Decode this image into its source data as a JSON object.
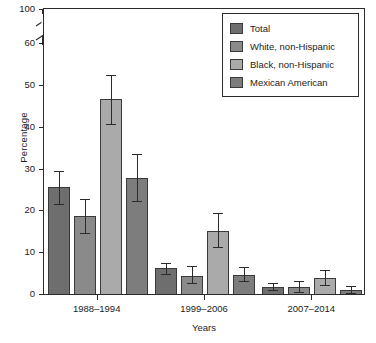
{
  "chart_data": {
    "type": "bar",
    "title": "",
    "xlabel": "Years",
    "ylabel": "Percentage",
    "categories": [
      "1988–1994",
      "1999–2006",
      "2007–2014"
    ],
    "ylim": [
      0,
      60
    ],
    "y_ticks": [
      0,
      10,
      20,
      30,
      40,
      50,
      60,
      100
    ],
    "y_tick_labels": [
      "0",
      "10",
      "20",
      "30",
      "40",
      "50",
      "60",
      "100"
    ],
    "axis_break": {
      "between": [
        60,
        100
      ],
      "present": true
    },
    "grid": false,
    "legend_position": "top-right",
    "series": [
      {
        "name": "Total",
        "color": "#6e6e6e",
        "values": [
          25.8,
          6.4,
          1.9
        ],
        "err_low": [
          21.8,
          5.0,
          1.1
        ],
        "err_high": [
          29.7,
          7.7,
          2.9
        ]
      },
      {
        "name": "White, non-Hispanic",
        "color": "#8a8a8a",
        "values": [
          18.8,
          4.5,
          1.8
        ],
        "err_low": [
          14.8,
          2.9,
          0.6
        ],
        "err_high": [
          23.0,
          6.9,
          3.3
        ]
      },
      {
        "name": "Black, non-Hispanic",
        "color": "#aaaaaa",
        "values": [
          46.8,
          15.2,
          4.0
        ],
        "err_low": [
          40.8,
          11.5,
          2.5
        ],
        "err_high": [
          52.7,
          19.6,
          6.0
        ]
      },
      {
        "name": "Mexican American",
        "color": "#7d7d7d",
        "values": [
          28.0,
          4.9,
          1.2
        ],
        "err_low": [
          22.5,
          3.3,
          0.4
        ],
        "err_high": [
          33.7,
          6.6,
          2.2
        ]
      }
    ]
  },
  "axis": {
    "y_label": "Percentage",
    "x_label": "Years",
    "y_tick_labels": [
      "100",
      "60",
      "50",
      "40",
      "30",
      "20",
      "10",
      "0"
    ],
    "x_tick_labels": [
      "1988–1994",
      "1999–2006",
      "2007–2014"
    ]
  },
  "legend": {
    "items": [
      {
        "label": "Total",
        "color": "#6e6e6e"
      },
      {
        "label": "White, non-Hispanic",
        "color": "#8a8a8a"
      },
      {
        "label": "Black, non-Hispanic",
        "color": "#aaaaaa"
      },
      {
        "label": "Mexican American",
        "color": "#7d7d7d"
      }
    ]
  }
}
